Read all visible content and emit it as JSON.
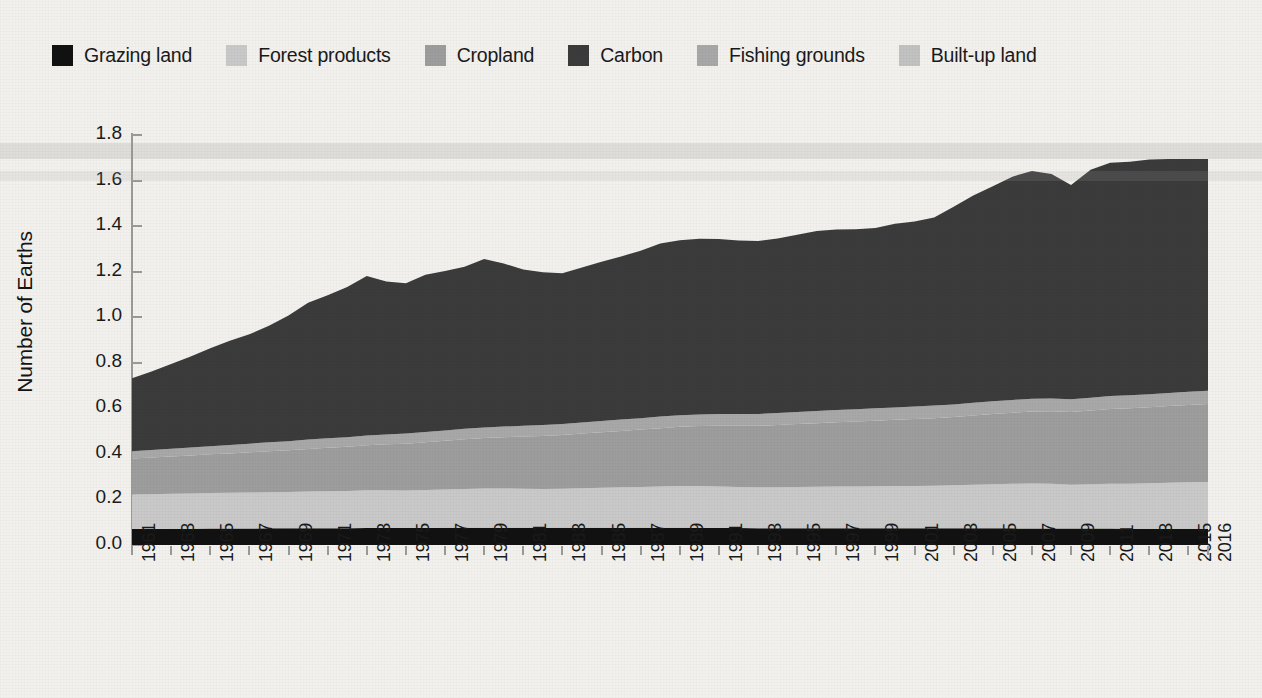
{
  "legend": {
    "items": [
      {
        "label": "Grazing land",
        "color": "#111111",
        "key": "grazing_land"
      },
      {
        "label": "Forest products",
        "color": "#c9c9c9",
        "key": "forest_products"
      },
      {
        "label": "Cropland",
        "color": "#9d9d9d",
        "key": "cropland"
      },
      {
        "label": "Carbon",
        "color": "#3b3b3b",
        "key": "carbon"
      },
      {
        "label": "Fishing grounds",
        "color": "#a8a8a8",
        "key": "fishing_grounds"
      },
      {
        "label": "Built-up land",
        "color": "#c2c2c2",
        "key": "built_up_land"
      }
    ]
  },
  "axes": {
    "y_title": "Number of Earths",
    "y_ticks": [
      "0.0",
      "0.2",
      "0.4",
      "0.6",
      "0.8",
      "1.0",
      "1.2",
      "1.4",
      "1.6",
      "1.8"
    ],
    "y_min": 0.0,
    "y_max": 1.8,
    "x_min": 1961,
    "x_max": 2016,
    "x_tick_labels": [
      "1961",
      "1963",
      "1965",
      "1967",
      "1969",
      "1971",
      "1973",
      "1975",
      "1977",
      "1979",
      "1981",
      "1983",
      "1985",
      "1987",
      "1989",
      "1991",
      "1993",
      "1995",
      "1997",
      "1999",
      "2001",
      "2003",
      "2005",
      "2007",
      "2009",
      "2011",
      "2013",
      "2015",
      "2016"
    ]
  },
  "chart_data": {
    "type": "area",
    "title": "",
    "xlabel": "",
    "ylabel": "Number of Earths",
    "ylim": [
      0.0,
      1.8
    ],
    "xlim": [
      1961,
      2016
    ],
    "grid": false,
    "legend_position": "top",
    "stacked": true,
    "stack_order": [
      "grazing_land",
      "forest_products",
      "cropland",
      "fishing_grounds",
      "carbon",
      "built_up_land"
    ],
    "x": [
      1961,
      1962,
      1963,
      1964,
      1965,
      1966,
      1967,
      1968,
      1969,
      1970,
      1971,
      1972,
      1973,
      1974,
      1975,
      1976,
      1977,
      1978,
      1979,
      1980,
      1981,
      1982,
      1983,
      1984,
      1985,
      1986,
      1987,
      1988,
      1989,
      1990,
      1991,
      1992,
      1993,
      1994,
      1995,
      1996,
      1997,
      1998,
      1999,
      2000,
      2001,
      2002,
      2003,
      2004,
      2005,
      2006,
      2007,
      2008,
      2009,
      2010,
      2011,
      2012,
      2013,
      2014,
      2015,
      2016
    ],
    "series": [
      {
        "name": "Grazing land",
        "color": "#111111",
        "values": [
          0.07,
          0.07,
          0.071,
          0.071,
          0.072,
          0.072,
          0.072,
          0.073,
          0.073,
          0.074,
          0.074,
          0.074,
          0.075,
          0.075,
          0.075,
          0.075,
          0.076,
          0.076,
          0.076,
          0.076,
          0.076,
          0.076,
          0.076,
          0.076,
          0.076,
          0.076,
          0.076,
          0.076,
          0.076,
          0.076,
          0.075,
          0.075,
          0.074,
          0.074,
          0.074,
          0.074,
          0.074,
          0.074,
          0.074,
          0.073,
          0.073,
          0.073,
          0.073,
          0.073,
          0.073,
          0.073,
          0.072,
          0.072,
          0.072,
          0.072,
          0.072,
          0.071,
          0.071,
          0.071,
          0.071,
          0.071
        ]
      },
      {
        "name": "Forest products",
        "color": "#c9c9c9",
        "values": [
          0.152,
          0.153,
          0.154,
          0.155,
          0.156,
          0.157,
          0.158,
          0.159,
          0.16,
          0.161,
          0.162,
          0.163,
          0.165,
          0.165,
          0.164,
          0.166,
          0.168,
          0.17,
          0.172,
          0.172,
          0.171,
          0.17,
          0.171,
          0.173,
          0.175,
          0.177,
          0.179,
          0.181,
          0.183,
          0.183,
          0.182,
          0.18,
          0.179,
          0.18,
          0.181,
          0.182,
          0.183,
          0.183,
          0.184,
          0.186,
          0.186,
          0.187,
          0.189,
          0.192,
          0.194,
          0.196,
          0.198,
          0.197,
          0.192,
          0.195,
          0.197,
          0.198,
          0.2,
          0.202,
          0.204,
          0.206
        ]
      },
      {
        "name": "Cropland",
        "color": "#9d9d9d",
        "values": [
          0.158,
          0.161,
          0.164,
          0.167,
          0.17,
          0.173,
          0.177,
          0.18,
          0.183,
          0.187,
          0.191,
          0.194,
          0.198,
          0.202,
          0.206,
          0.21,
          0.214,
          0.218,
          0.222,
          0.225,
          0.229,
          0.233,
          0.236,
          0.24,
          0.244,
          0.248,
          0.252,
          0.256,
          0.26,
          0.263,
          0.266,
          0.268,
          0.27,
          0.273,
          0.276,
          0.279,
          0.282,
          0.285,
          0.288,
          0.291,
          0.294,
          0.297,
          0.3,
          0.304,
          0.308,
          0.312,
          0.316,
          0.318,
          0.32,
          0.324,
          0.328,
          0.331,
          0.334,
          0.337,
          0.34,
          0.342
        ]
      },
      {
        "name": "Fishing grounds",
        "color": "#a8a8a8",
        "values": [
          0.032,
          0.033,
          0.034,
          0.035,
          0.036,
          0.037,
          0.038,
          0.039,
          0.04,
          0.041,
          0.042,
          0.042,
          0.043,
          0.043,
          0.044,
          0.045,
          0.045,
          0.046,
          0.046,
          0.047,
          0.047,
          0.048,
          0.048,
          0.049,
          0.049,
          0.05,
          0.05,
          0.051,
          0.051,
          0.051,
          0.052,
          0.052,
          0.052,
          0.053,
          0.053,
          0.053,
          0.054,
          0.054,
          0.054,
          0.054,
          0.055,
          0.055,
          0.055,
          0.055,
          0.056,
          0.056,
          0.056,
          0.056,
          0.056,
          0.056,
          0.057,
          0.057,
          0.057,
          0.057,
          0.058,
          0.058
        ]
      },
      {
        "name": "Carbon",
        "color": "#3b3b3b",
        "values": [
          0.32,
          0.345,
          0.372,
          0.4,
          0.43,
          0.458,
          0.48,
          0.512,
          0.552,
          0.6,
          0.628,
          0.66,
          0.7,
          0.672,
          0.66,
          0.69,
          0.7,
          0.712,
          0.74,
          0.716,
          0.686,
          0.67,
          0.662,
          0.68,
          0.7,
          0.716,
          0.735,
          0.76,
          0.768,
          0.772,
          0.768,
          0.762,
          0.76,
          0.766,
          0.778,
          0.79,
          0.792,
          0.79,
          0.792,
          0.806,
          0.812,
          0.826,
          0.868,
          0.91,
          0.944,
          0.98,
          1.0,
          0.986,
          0.94,
          1.0,
          1.024,
          1.026,
          1.03,
          1.028,
          1.022,
          1.018
        ]
      },
      {
        "name": "Built-up land",
        "color": "#c2c2c2",
        "values": [
          0.01,
          0.01,
          0.01,
          0.01,
          0.01,
          0.01,
          0.01,
          0.01,
          0.01,
          0.01,
          0.011,
          0.011,
          0.011,
          0.011,
          0.011,
          0.011,
          0.011,
          0.011,
          0.011,
          0.011,
          0.012,
          0.012,
          0.012,
          0.012,
          0.012,
          0.012,
          0.012,
          0.012,
          0.012,
          0.012,
          0.013,
          0.013,
          0.013,
          0.013,
          0.013,
          0.013,
          0.013,
          0.013,
          0.013,
          0.013,
          0.014,
          0.014,
          0.014,
          0.014,
          0.014,
          0.014,
          0.014,
          0.014,
          0.014,
          0.014,
          0.015,
          0.015,
          0.015,
          0.015,
          0.015,
          0.015
        ]
      }
    ],
    "totals": [
      0.742,
      0.772,
      0.805,
      0.838,
      0.874,
      0.907,
      0.935,
      0.973,
      1.018,
      1.073,
      1.108,
      1.144,
      1.192,
      1.168,
      1.16,
      1.197,
      1.214,
      1.233,
      1.267,
      1.247,
      1.221,
      1.209,
      1.205,
      1.23,
      1.256,
      1.279,
      1.304,
      1.336,
      1.35,
      1.357,
      1.356,
      1.35,
      1.348,
      1.359,
      1.375,
      1.391,
      1.398,
      1.399,
      1.405,
      1.423,
      1.434,
      1.452,
      1.499,
      1.548,
      1.589,
      1.631,
      1.656,
      1.643,
      1.594,
      1.661,
      1.693,
      1.698,
      1.707,
      1.71,
      1.71,
      1.71
    ]
  }
}
